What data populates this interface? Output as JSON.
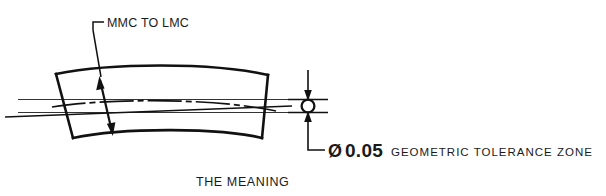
{
  "figure": {
    "type": "gdnt-technical-drawing",
    "caption": "THE MEANING",
    "background_color": "#ffffff",
    "line_color": "#111111",
    "thin_line_color": "#333333"
  },
  "annotations": {
    "mmc_lmc_callout": "MMC TO LMC",
    "diameter_symbol": "Ø",
    "diameter_value": "0.05",
    "tolerance_zone_label": "GEOMETRIC TOLERANCE ZONE"
  },
  "elements": {
    "part_outline_name": "curved-bar-part",
    "centerline_name": "part-centerline",
    "tolerance_zone_name": "tolerance-zone-band",
    "zone_circle_name": "tolerance-zone-circle",
    "dimension_arrow_name": "zone-diameter-dimension",
    "mmc_arrow_name": "mmc-to-lmc-double-arrow"
  }
}
